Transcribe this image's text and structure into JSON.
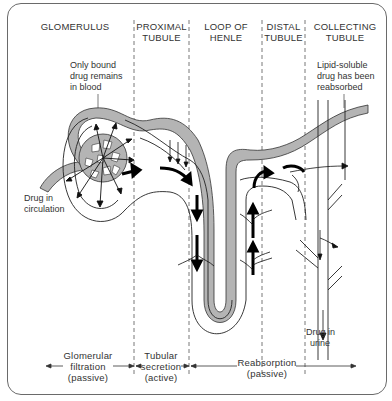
{
  "diagram": {
    "sections": [
      {
        "id": "glomerulus",
        "line1": "GLOMERULUS",
        "line2": ""
      },
      {
        "id": "proximal",
        "line1": "PROXIMAL",
        "line2": "TUBULE"
      },
      {
        "id": "loop",
        "line1": "LOOP OF",
        "line2": "HENLE"
      },
      {
        "id": "distal",
        "line1": "DISTAL",
        "line2": "TUBULE"
      },
      {
        "id": "collecting",
        "line1": "COLLECTING",
        "line2": "TUBULE"
      }
    ],
    "annotations": {
      "bound_drug": [
        "Only bound",
        "drug remains",
        "in blood"
      ],
      "lipid_soluble": [
        "Lipid-soluble",
        "drug has been",
        "reabsorbed"
      ],
      "circulation": [
        "Drug in",
        "circulation"
      ],
      "urine": [
        "Drug in",
        "urine"
      ]
    },
    "processes": [
      {
        "id": "filtration",
        "lines": [
          "Glomerular",
          "filtration",
          "(passive)"
        ]
      },
      {
        "id": "secretion",
        "lines": [
          "Tubular",
          "secretion",
          "(active)"
        ]
      },
      {
        "id": "reabsorption",
        "lines": [
          "Reabsorption",
          "(passive)"
        ]
      }
    ],
    "colors": {
      "vessel_fill": "#b4b4b4",
      "stroke": "#222222",
      "divider": "#555555",
      "frame": "#6a6a6a"
    }
  }
}
